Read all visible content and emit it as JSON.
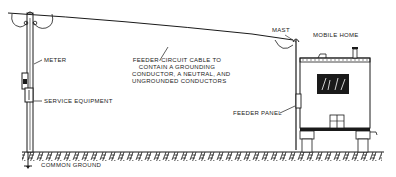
{
  "diagram": {
    "type": "electrical-service-to-mobile-home",
    "colors": {
      "ink": "#1a1a1a",
      "background": "#ffffff"
    },
    "labels": {
      "meter": "METER",
      "service_equipment": "SERVICE EQUIPMENT",
      "common_ground": "COMMON GROUND",
      "mast": "MAST",
      "mobile_home": "MOBILE HOME",
      "feeder_panel": "FEEDER PANEL",
      "feeder_cable_line1": "FEEDER-CIRCUIT CABLE TO",
      "feeder_cable_line2": "CONTAIN A GROUNDING",
      "feeder_cable_line3": "CONDUCTOR, A NEUTRAL, AND",
      "feeder_cable_line4": "UNGROUNDED CONDUCTORS"
    },
    "components": [
      "utility-pole",
      "meter",
      "service-equipment",
      "ground-rod",
      "feeder-cable",
      "mast",
      "mobile-home",
      "feeder-panel",
      "ground-surface"
    ]
  }
}
